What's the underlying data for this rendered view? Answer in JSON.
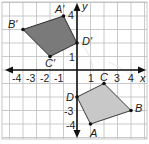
{
  "figure": {
    "type": "coordinate-plane-rotation",
    "axes": {
      "x_label": "x",
      "y_label": "y",
      "x_ticks": [
        "-4",
        "-3",
        "-2",
        "-1",
        "1",
        "C",
        "3",
        "4"
      ],
      "y_ticks": [
        "4",
        "1",
        "-3",
        "-4"
      ],
      "x_range": [
        -5.5,
        5
      ],
      "y_range": [
        -5,
        5
      ]
    },
    "grid": {
      "origin_px": [
        77,
        70
      ],
      "unit_px": 13.5,
      "color": "#bdbdbd"
    },
    "quadrilaterals": [
      {
        "name": "ABCD",
        "fill": "#c8c8c8",
        "stroke": "#3a3a3a",
        "vertices": [
          {
            "label": "A",
            "x": 1,
            "y": -4
          },
          {
            "label": "B",
            "x": 4,
            "y": -3
          },
          {
            "label": "C",
            "x": 2,
            "y": -1
          },
          {
            "label": "D",
            "x": 0,
            "y": -2
          }
        ]
      },
      {
        "name": "A'B'C'D'",
        "fill": "#7a7a7a",
        "stroke": "#2a2a2a",
        "vertices": [
          {
            "label": "A'",
            "x": -1,
            "y": 4
          },
          {
            "label": "B'",
            "x": -4,
            "y": 3
          },
          {
            "label": "C'",
            "x": -2,
            "y": 1
          },
          {
            "label": "D'",
            "x": 0,
            "y": 2
          }
        ]
      }
    ],
    "labels": {
      "A": "A",
      "B": "B",
      "C": "C",
      "D": "D",
      "A_prime": "A′",
      "B_prime": "B′",
      "C_prime": "C′",
      "D_prime": "D′"
    }
  }
}
